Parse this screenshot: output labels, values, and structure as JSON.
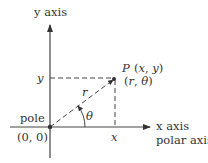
{
  "diagram": {
    "labels": {
      "y_axis": "y axis",
      "x_axis": "x axis",
      "polar_axis": "polar axis",
      "pole": "pole",
      "origin": "(0, 0)",
      "point_name": "P",
      "point_rect": "(x, y)",
      "point_polar": "(r, θ)",
      "r": "r",
      "theta": "θ",
      "x_tick": "x",
      "y_tick": "y"
    },
    "colors": {
      "ink": "#333333",
      "dash": "#444444"
    }
  }
}
